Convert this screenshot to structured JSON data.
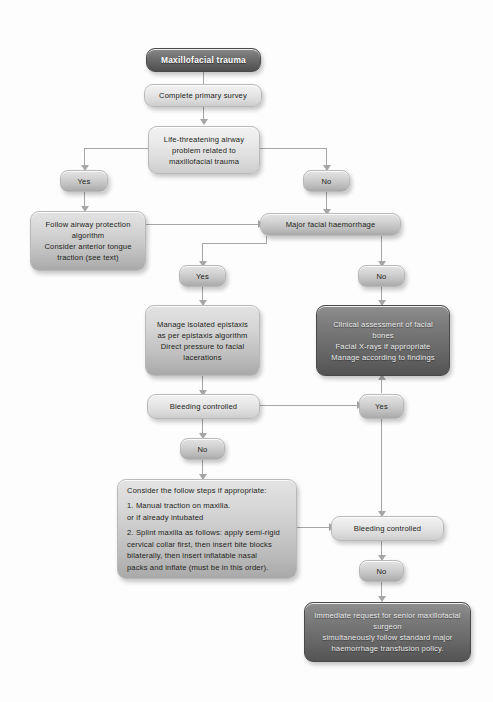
{
  "diagram": {
    "nodes": {
      "start": "Maxillofacial trauma",
      "primary_survey": "Complete primary survey",
      "airway_question": "Life-threatening airway problem related to maxillofacial trauma",
      "airway_yes": "Yes",
      "airway_no": "No",
      "airway_protection": "Follow airway protection algorithm\nConsider anterior tongue traction (see text)",
      "haemorrhage_question": "Major facial haemorrhage",
      "haemorrhage_yes": "Yes",
      "haemorrhage_no": "No",
      "epistaxis_management": "Manage isolated epistaxis as per epistaxis algorithm\nDirect pressure to facial lacerations",
      "clinical_assessment": "Clinical assessment of facial bones\nFacial X-rays if appropriate\nManage according to findings",
      "bleeding_controlled_1": "Bleeding controlled",
      "bleeding_yes_1": "Yes",
      "bleeding_no_1": "No",
      "follow_steps_heading": "Consider the follow steps if appropriate:",
      "follow_steps_item_1": "1. Manual traction on maxilla. or if already intubated",
      "follow_steps_item_2": "2. Splint maxilla as follows: apply semi-rigid cervical collar first, then insert bite blocks bilaterally, then insert inflatable nasal packs and inflate (must be in this order).",
      "bleeding_controlled_2": "Bleeding controlled",
      "bleeding_no_2": "No",
      "senior_request": "Immediate request for senior maxillofacial surgeon simultaneously follow standard major haemorrhage transfusion policy."
    },
    "node_lines": {
      "airway_question": [
        "Life-threatening airway",
        "problem related to",
        "maxillofacial trauma"
      ],
      "airway_protection": [
        "Follow airway protection",
        "algorithm",
        "Consider anterior tongue",
        "traction (see text)"
      ],
      "epistaxis_management": [
        "Manage isolated epistaxis",
        "as per epistaxis algorithm",
        "Direct pressure to facial",
        "lacerations"
      ],
      "clinical_assessment": [
        "Clinical assessment of facial",
        "bones",
        "Facial X-rays if appropriate",
        "Manage according to findings"
      ],
      "follow_steps_item_1": [
        "1. Manual traction on maxilla.",
        "or if already intubated"
      ],
      "follow_steps_item_2": [
        "2. Splint maxilla as follows: apply semi-rigid",
        "cervical collar first, then insert bite blocks",
        "bilaterally, then insert inflatable nasal",
        "packs and inflate (must be in this order)."
      ],
      "senior_request": [
        "Immediate request for senior maxillofacial",
        "surgeon",
        "simultaneously follow standard major",
        "haemorrhage transfusion policy."
      ]
    },
    "colors": {
      "background": "#fdfdfd",
      "node_light": "#e9e9e9",
      "node_mid": "#c9c9c9",
      "node_dark": "#6a6a6a",
      "connector": "#a6a6a6",
      "text_dark": "#231f20",
      "text_light": "#e9e9e9"
    }
  }
}
